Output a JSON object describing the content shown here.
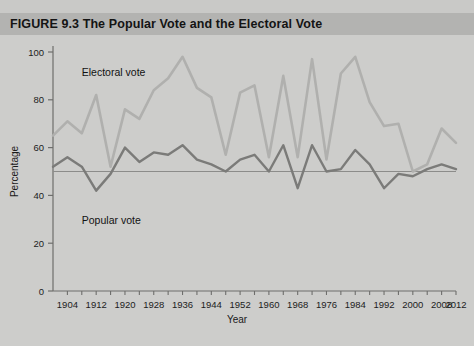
{
  "figure": {
    "label": "FIGURE 9.3",
    "title": "The Popular Vote and the Electoral Vote",
    "full_title": "FIGURE 9.3  The Popular Vote and the Electoral Vote"
  },
  "colors": {
    "background": "#c9c9c7",
    "header_band": "#b3b3b1",
    "plot_background": "#cdcdcb",
    "electoral_line": "#b0b0ae",
    "popular_line": "#7b7b79",
    "axis": "#6e6e6c",
    "reference_line": "#8c8c8a",
    "text": "#141414"
  },
  "chart_data": {
    "type": "line",
    "title": "The Popular Vote and the Electoral Vote",
    "xlabel": "Year",
    "ylabel": "Percentage",
    "xlim": [
      1900,
      2012
    ],
    "ylim": [
      0,
      100
    ],
    "grid": false,
    "legend": "inline-labels",
    "y_ticks": [
      0,
      20,
      40,
      60,
      80,
      100
    ],
    "x_ticks": [
      1904,
      1912,
      1920,
      1928,
      1936,
      1944,
      1952,
      1960,
      1968,
      1976,
      1984,
      1992,
      2000,
      2008,
      2012
    ],
    "x_minor_tick_step": 4,
    "reference_line": {
      "value": 50,
      "axis": "y",
      "label": "50 percent"
    },
    "x": [
      1900,
      1904,
      1908,
      1912,
      1916,
      1920,
      1924,
      1928,
      1932,
      1936,
      1940,
      1944,
      1948,
      1952,
      1956,
      1960,
      1964,
      1968,
      1972,
      1976,
      1980,
      1984,
      1988,
      1992,
      1996,
      2000,
      2004,
      2008,
      2012
    ],
    "series": [
      {
        "name": "Electoral vote",
        "color": "#b0b0ae",
        "values": [
          65,
          71,
          66,
          82,
          52,
          76,
          72,
          84,
          89,
          98,
          85,
          81,
          57,
          83,
          86,
          56,
          90,
          56,
          97,
          55,
          91,
          98,
          79,
          69,
          70,
          50,
          53,
          68,
          62
        ]
      },
      {
        "name": "Popular vote",
        "color": "#7b7b79",
        "values": [
          52,
          56,
          52,
          42,
          49,
          60,
          54,
          58,
          57,
          61,
          55,
          53,
          50,
          55,
          57,
          50,
          61,
          43,
          61,
          50,
          51,
          59,
          53,
          43,
          49,
          48,
          51,
          53,
          51
        ]
      }
    ],
    "annotations": [
      {
        "text": "Electoral vote",
        "x": 1908,
        "y": 90
      },
      {
        "text": "Popular vote",
        "x": 1908,
        "y": 28
      }
    ]
  },
  "axis": {
    "y_title": "Percentage",
    "x_title": "Year",
    "y_tick_labels": [
      "0",
      "20",
      "40",
      "60",
      "80",
      "100"
    ],
    "x_tick_labels": [
      "1904",
      "1912",
      "1920",
      "1928",
      "1936",
      "1944",
      "1952",
      "1960",
      "1968",
      "1976",
      "1984",
      "1992",
      "2000",
      "2008",
      "2012"
    ]
  },
  "labels": {
    "electoral": "Electoral vote",
    "popular": "Popular vote"
  }
}
